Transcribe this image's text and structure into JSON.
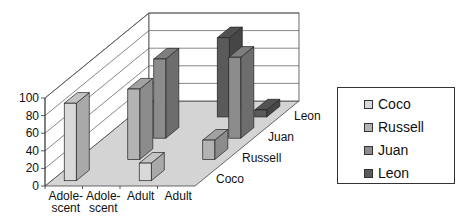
{
  "chart_data": {
    "type": "bar",
    "subtype": "3d-bar-depth",
    "title": "",
    "xlabel": "",
    "ylabel": "",
    "ylim": [
      0,
      100
    ],
    "yticks": [
      "0",
      "20",
      "40",
      "60",
      "80",
      "100"
    ],
    "categories": [
      "Adole-\nscent",
      "Adole-\nscent",
      "Adult",
      "Adult"
    ],
    "category_lines": [
      [
        "Adole-",
        "scent"
      ],
      [
        "Adole-",
        "scent"
      ],
      [
        "Adult"
      ],
      [
        "Adult"
      ]
    ],
    "series": [
      {
        "name": "Coco",
        "color": "#d9d9d9",
        "values": [
          88,
          null,
          20,
          null
        ]
      },
      {
        "name": "Russell",
        "color": "#b3b3b3",
        "values": [
          null,
          80,
          null,
          22
        ]
      },
      {
        "name": "Juan",
        "color": "#8c8c8c",
        "values": [
          null,
          90,
          null,
          92
        ]
      },
      {
        "name": "Leon",
        "color": "#5a5a5a",
        "values": [
          null,
          null,
          90,
          8
        ]
      }
    ],
    "depth_labels": [
      "Coco",
      "Russell",
      "Juan",
      "Leon"
    ],
    "grid": true,
    "legend_position": "right"
  },
  "legend": {
    "items": [
      {
        "label": "Coco",
        "color": "#d9d9d9"
      },
      {
        "label": "Russell",
        "color": "#b3b3b3"
      },
      {
        "label": "Juan",
        "color": "#8c8c8c"
      },
      {
        "label": "Leon",
        "color": "#5a5a5a"
      }
    ]
  }
}
